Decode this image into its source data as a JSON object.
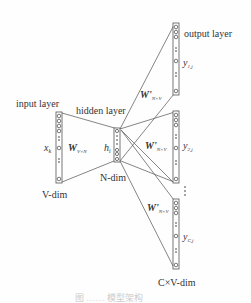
{
  "labels": {
    "input_layer": "input layer",
    "hidden_layer": "hidden layer",
    "output_layer": "output layer",
    "x_k": "x",
    "x_k_sub": "k",
    "W": "W",
    "W_sub": "V×N",
    "h_i": "h",
    "h_i_sub": "i",
    "W_prime_1": "W'",
    "W_prime_1_sub": "N×V",
    "W_prime_2": "W'",
    "W_prime_2_sub": "N×V",
    "W_prime_3": "W'",
    "W_prime_3_sub": "N×V",
    "y_1": "y",
    "y_1_sub": "1,j",
    "y_2": "y",
    "y_2_sub": "2,j",
    "y_C": "y",
    "y_C_sub": "C,j",
    "v_dim": "V-dim",
    "n_dim": "N-dim",
    "cv_dim": "C×V-dim",
    "vertical_ellipsis": "⋮"
  },
  "caption": "图  ……  模型架构",
  "colors": {
    "line": "#555555",
    "text": "#333333",
    "caption": "#cccccc"
  }
}
